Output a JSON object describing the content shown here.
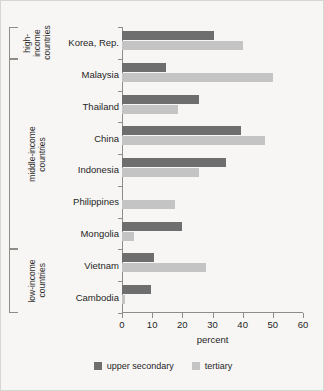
{
  "chart_data": {
    "type": "bar",
    "orientation": "horizontal",
    "title": "",
    "xlabel": "percent",
    "ylabel": "",
    "xlim": [
      0,
      60
    ],
    "xticks": [
      0,
      10,
      20,
      30,
      40,
      50,
      60
    ],
    "grid": false,
    "legend_position": "bottom",
    "categories": [
      "Korea, Rep.",
      "Malaysia",
      "Thailand",
      "China",
      "Indonesia",
      "Philippines",
      "Mongolia",
      "Vietnam",
      "Cambodia"
    ],
    "series": [
      {
        "name": "upper secondary",
        "color": "#6e6e6e",
        "values": [
          30.5,
          14.5,
          25.5,
          39.5,
          34.5,
          0,
          20.0,
          10.5,
          9.7
        ]
      },
      {
        "name": "tertiary",
        "color": "#c4c4c4",
        "values": [
          40.0,
          50.0,
          18.5,
          47.5,
          25.5,
          17.5,
          4.0,
          28.0,
          1.0
        ]
      }
    ],
    "groups": [
      {
        "label": "high-\nincome\ncountries",
        "categories": [
          "Korea, Rep."
        ]
      },
      {
        "label": "middle-income\ncountries",
        "categories": [
          "Malaysia",
          "Thailand",
          "China",
          "Indonesia",
          "Philippines",
          "Mongolia"
        ]
      },
      {
        "label": "low-income\ncountries",
        "categories": [
          "Vietnam",
          "Cambodia"
        ]
      }
    ]
  },
  "legend": {
    "items": [
      {
        "label": "upper secondary",
        "color": "#6e6e6e"
      },
      {
        "label": "tertiary",
        "color": "#c4c4c4"
      }
    ]
  }
}
